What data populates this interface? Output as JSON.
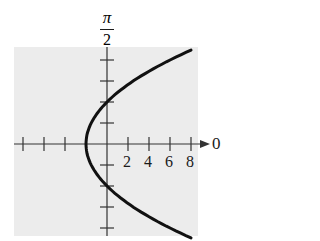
{
  "chart_data": {
    "type": "line",
    "title": "",
    "coordinate_system": "polar",
    "equation": "r = 4/(1 - cos θ)  (parabola y^2 = 8(x + 2))",
    "polar_axis_label": "0",
    "vertical_axis_label": "π/2",
    "vertical_axis_label_parts": {
      "numerator": "π",
      "denominator": "2"
    },
    "x_tick_labels": [
      "2",
      "4",
      "6",
      "8"
    ],
    "x_ticks": [
      -8,
      -6,
      -4,
      -2,
      0,
      2,
      4,
      6,
      8
    ],
    "y_ticks": [
      -8,
      -6,
      -4,
      -2,
      0,
      2,
      4,
      6,
      8
    ],
    "xlim": [
      -9,
      8
    ],
    "ylim": [
      -9,
      9
    ],
    "grid": false,
    "background": "#ececec",
    "series": [
      {
        "name": "parabola",
        "color": "#111111",
        "points": [
          [
            8,
            8.94
          ],
          [
            6,
            8.0
          ],
          [
            4,
            6.93
          ],
          [
            2,
            5.66
          ],
          [
            0,
            4.0
          ],
          [
            -1,
            2.83
          ],
          [
            -2,
            0
          ],
          [
            -1,
            -2.83
          ],
          [
            0,
            -4.0
          ],
          [
            2,
            -5.66
          ],
          [
            4,
            -6.93
          ],
          [
            6,
            -8.0
          ],
          [
            8,
            -8.94
          ]
        ],
        "vertex": [
          -2,
          0
        ],
        "y_intercepts": [
          4,
          -4
        ]
      }
    ]
  },
  "labels": {
    "pi_num": "π",
    "pi_den": "2",
    "zero": "0",
    "ticks": [
      "2",
      "4",
      "6",
      "8"
    ]
  }
}
